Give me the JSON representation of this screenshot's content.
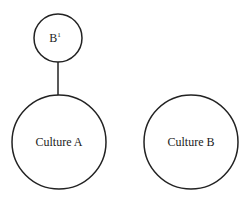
{
  "diagram": {
    "nodes": [
      {
        "id": "b1",
        "label": "B",
        "superscript": "1",
        "cx": 58,
        "cy": 38,
        "r": 24
      },
      {
        "id": "culture-a",
        "label": "Culture A",
        "cx": 59,
        "cy": 142,
        "r": 47
      },
      {
        "id": "culture-b",
        "label": "Culture B",
        "cx": 191,
        "cy": 142,
        "r": 47
      }
    ],
    "edges": [
      {
        "from": "b1",
        "to": "culture-a"
      }
    ],
    "colors": {
      "stroke": "#222222",
      "background": "#ffffff"
    }
  }
}
